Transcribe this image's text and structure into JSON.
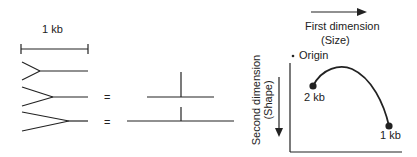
{
  "scale": {
    "label": "1 kb"
  },
  "equals": [
    "=",
    "="
  ],
  "graph": {
    "x_axis_title": "First dimension",
    "x_axis_subtitle": "(Size)",
    "y_axis_title": "Second dimension",
    "y_axis_subtitle": "(Shape)",
    "origin_label": "Origin",
    "points": [
      {
        "label": "2 kb"
      },
      {
        "label": "1 kb"
      }
    ]
  },
  "colors": {
    "stroke": "#222222",
    "background": "#ffffff"
  }
}
